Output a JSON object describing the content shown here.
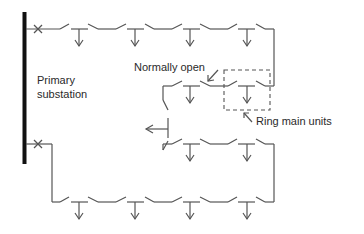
{
  "diagram": {
    "labels": {
      "substation_line1": "Primary",
      "substation_line2": "substation",
      "normally_open": "Normally open",
      "ring_main_units": "Ring main units"
    },
    "components": {
      "busbar": "primary-substation-busbar",
      "circuit_breakers": 2,
      "upper_ring_load_points": 8,
      "lower_ring_load_points": 8,
      "branch_feeder_arrows": 1,
      "normally_open_points": 1,
      "highlighted_ring_main_unit_box": 1
    },
    "colors": {
      "line": "#555555",
      "busbar": "#111111",
      "text": "#2a2a2a",
      "background": "#ffffff"
    }
  }
}
